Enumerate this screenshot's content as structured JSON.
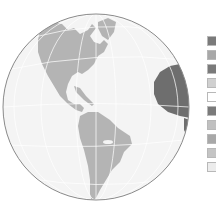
{
  "map": {
    "projection": "orthographic",
    "region": "Americas",
    "colors": {
      "ocean": "#f4f4f4",
      "land": "#b4b4b4",
      "land_highlight": "#6e6e6e",
      "graticule": "#ffffff",
      "outline": "#8a8a8a"
    }
  },
  "legend": {
    "swatches": [
      {
        "color": "#7a7a7a"
      },
      {
        "color": "#a8a8a8"
      },
      {
        "color": "#7a7a7a"
      },
      {
        "color": "#d0d0d0"
      },
      {
        "color": "#ffffff"
      },
      {
        "color": "#7a7a7a"
      },
      {
        "color": "#c0c0c0"
      },
      {
        "color": "#a8a8a8"
      },
      {
        "color": "#c4c4c4"
      },
      {
        "color": "#ececec"
      }
    ]
  }
}
